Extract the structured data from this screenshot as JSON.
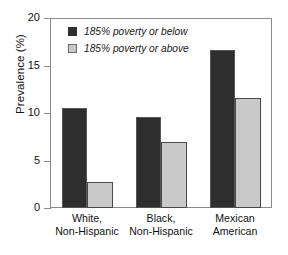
{
  "chart_data": {
    "type": "bar",
    "title": "",
    "subtitle": "",
    "xlabel": "",
    "ylabel": "Prevalence (%)",
    "ylim": [
      0,
      20
    ],
    "yticks": [
      0,
      5,
      10,
      15,
      20
    ],
    "ytick_labels": [
      "0",
      "5",
      "10",
      "15",
      "20"
    ],
    "grid": false,
    "legend_position": "top-left",
    "categories": [
      "White, Non-Hispanic",
      "Black, Non-Hispanic",
      "Mexican American"
    ],
    "category_lines": [
      [
        "White,",
        "Non-Hispanic"
      ],
      [
        "Black,",
        "Non-Hispanic"
      ],
      [
        "Mexican",
        "American"
      ]
    ],
    "series": [
      {
        "name": "185% poverty or below",
        "color": "#2e2e2e",
        "values": [
          10.5,
          9.6,
          16.6
        ]
      },
      {
        "name": "185% poverty or above",
        "color": "#c9c9c9",
        "values": [
          2.7,
          7.0,
          11.6
        ]
      }
    ]
  },
  "legend": {
    "items": [
      {
        "label": "185% poverty or below",
        "swatch": "dark"
      },
      {
        "label": "185% poverty or above",
        "swatch": "light"
      }
    ]
  }
}
